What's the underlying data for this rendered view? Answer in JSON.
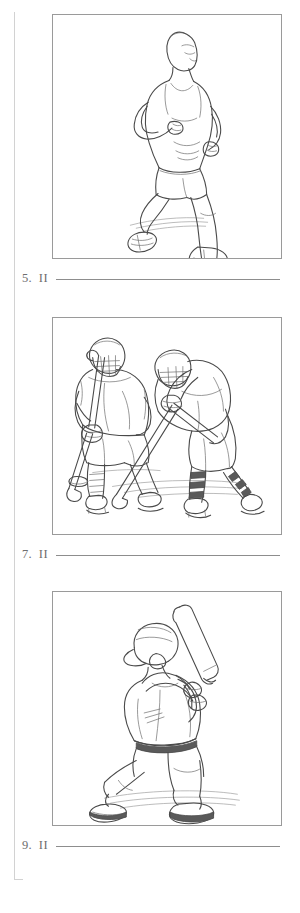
{
  "page": {
    "background_color": "#ffffff",
    "ink_color": "#4a4a4a",
    "text_color": "#6e6e6e",
    "rule_color": "#d2d2d2",
    "margin_rule": "vertical-margin-rule"
  },
  "items": [
    {
      "number": "5.",
      "marker": "II",
      "answer_value": "",
      "figure": {
        "name": "running-figure",
        "caption": "line drawing of a man running in a tank top and shorts"
      }
    },
    {
      "number": "7.",
      "marker": "II",
      "answer_value": "",
      "figure": {
        "name": "ice-hockey-figure",
        "caption": "line drawing of two ice hockey players with sticks and a puck"
      }
    },
    {
      "number": "9.",
      "marker": "II",
      "answer_value": "",
      "figure": {
        "name": "baseball-batter-figure",
        "caption": "line drawing of a baseball batter in batting stance holding a bat"
      }
    }
  ]
}
